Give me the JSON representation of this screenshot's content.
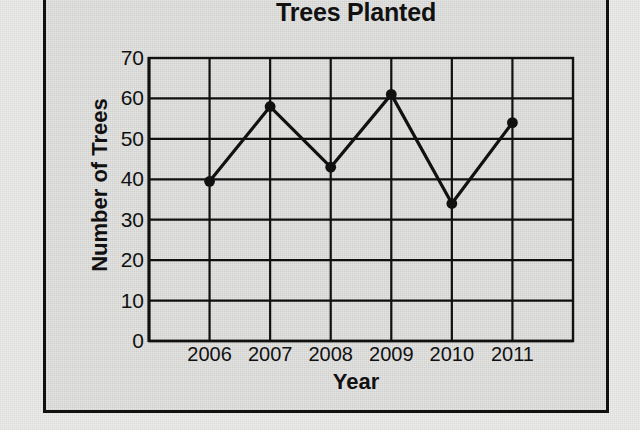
{
  "chart_data": {
    "type": "line",
    "title": "Trees Planted",
    "xlabel": "Year",
    "ylabel": "Number of Trees",
    "categories": [
      "2006",
      "2007",
      "2008",
      "2009",
      "2010",
      "2011"
    ],
    "values": [
      39.5,
      58,
      43,
      61,
      34,
      54
    ],
    "ylim": [
      0,
      70
    ],
    "ytick_labels": [
      "0",
      "10",
      "20",
      "30",
      "40",
      "50",
      "60",
      "70"
    ],
    "ytick_values": [
      0,
      10,
      20,
      30,
      40,
      50,
      60,
      70
    ],
    "grid": "both",
    "legend": "none",
    "series_color": "#111111",
    "marker": "filled-circle",
    "background_color": "#e3e3e2",
    "axis_color": "#111111"
  }
}
